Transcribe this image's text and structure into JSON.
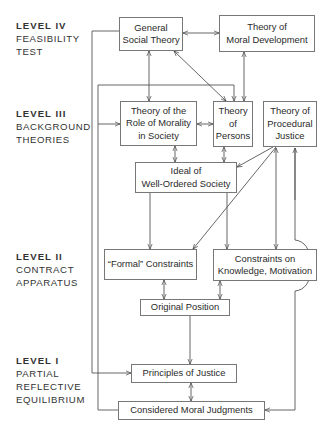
{
  "levels": [
    {
      "id": "level-iv",
      "title": "LEVEL IV",
      "lines": [
        "FEASIBILITY",
        "TEST"
      ]
    },
    {
      "id": "level-iii",
      "title": "LEVEL III",
      "lines": [
        "BACKGROUND",
        "THEORIES"
      ]
    },
    {
      "id": "level-ii",
      "title": "LEVEL II",
      "lines": [
        "CONTRACT",
        "APPARATUS"
      ]
    },
    {
      "id": "level-i",
      "title": "LEVEL I",
      "lines": [
        "PARTIAL",
        "REFLECTIVE",
        "EQUILIBRIUM"
      ]
    }
  ],
  "nodes": {
    "general_social_theory": {
      "lines": [
        "General",
        "Social Theory"
      ]
    },
    "moral_development": {
      "lines": [
        "Theory of",
        "Moral Development"
      ]
    },
    "role_of_morality": {
      "lines": [
        "Theory of the",
        "Role of Morality",
        "in Society"
      ]
    },
    "persons": {
      "lines": [
        "Theory",
        "of",
        "Persons"
      ]
    },
    "procedural_justice": {
      "lines": [
        "Theory of",
        "Procedural",
        "Justice"
      ]
    },
    "well_ordered_society": {
      "lines": [
        "Ideal of",
        "Well-Ordered Society"
      ]
    },
    "formal_constraints": {
      "lines": [
        "“Formal” Constraints"
      ]
    },
    "knowledge_motivation": {
      "lines": [
        "Constraints on",
        "Knowledge, Motivation"
      ]
    },
    "original_position": {
      "lines": [
        "Original Position"
      ]
    },
    "principles_of_justice": {
      "lines": [
        "Principles of Justice"
      ]
    },
    "considered_judgments": {
      "lines": [
        "Considered Moral Judgments"
      ]
    }
  },
  "edges": [
    {
      "from": "general_social_theory",
      "to": "moral_development",
      "type": "bidirectional"
    },
    {
      "from": "general_social_theory",
      "to": "role_of_morality",
      "type": "bidirectional"
    },
    {
      "from": "general_social_theory",
      "to": "persons",
      "type": "bidirectional"
    },
    {
      "from": "moral_development",
      "to": "persons",
      "type": "bidirectional"
    },
    {
      "from": "role_of_morality",
      "to": "persons",
      "type": "bidirectional"
    },
    {
      "from": "role_of_morality",
      "to": "well_ordered_society",
      "type": "bidirectional"
    },
    {
      "from": "persons",
      "to": "well_ordered_society",
      "type": "bidirectional"
    },
    {
      "from": "procedural_justice",
      "to": "well_ordered_society",
      "type": "directed"
    },
    {
      "from": "procedural_justice",
      "to": "formal_constraints",
      "type": "directed"
    },
    {
      "from": "procedural_justice",
      "to": "knowledge_motivation",
      "type": "bidirectional"
    },
    {
      "from": "well_ordered_society",
      "to": "formal_constraints",
      "type": "directed"
    },
    {
      "from": "well_ordered_society",
      "to": "knowledge_motivation",
      "type": "directed"
    },
    {
      "from": "formal_constraints",
      "to": "original_position",
      "type": "bidirectional"
    },
    {
      "from": "knowledge_motivation",
      "to": "original_position",
      "type": "bidirectional"
    },
    {
      "from": "original_position",
      "to": "principles_of_justice",
      "type": "directed"
    },
    {
      "from": "principles_of_justice",
      "to": "considered_judgments",
      "type": "bidirectional"
    },
    {
      "from": "general_social_theory",
      "to": "principles_of_justice",
      "type": "directed"
    },
    {
      "from": "considered_judgments",
      "to": "role_of_morality",
      "type": "directed"
    },
    {
      "from": "considered_judgments",
      "to": "persons",
      "type": "directed"
    },
    {
      "from": "considered_judgments",
      "to": "procedural_justice",
      "type": "bidirectional"
    }
  ]
}
